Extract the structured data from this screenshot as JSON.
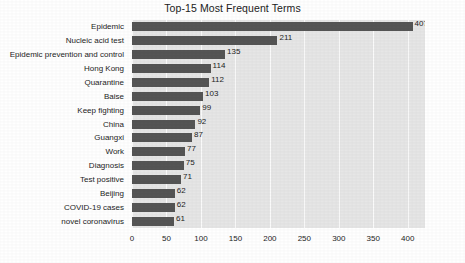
{
  "chart_data": {
    "type": "bar",
    "orientation": "horizontal",
    "title": "Top-15 Most Frequent Terms",
    "xlabel": "",
    "ylabel": "",
    "categories": [
      "Epidemic",
      "Nucleic acid test",
      "Epidemic prevention and control",
      "Hong Kong",
      "Quarantine",
      "Baise",
      "Keep fighting",
      "China",
      "Guangxi",
      "Work",
      "Diagnosis",
      "Test positive",
      "Beijing",
      "COVID-19 cases",
      "novel coronavirus"
    ],
    "values": [
      407,
      211,
      135,
      114,
      112,
      103,
      99,
      92,
      87,
      77,
      75,
      71,
      62,
      62,
      61
    ],
    "xlim": [
      0,
      425
    ],
    "xticks": [
      0,
      50,
      100,
      150,
      200,
      250,
      300,
      350,
      400
    ],
    "xtick_labels": [
      "0",
      "50",
      "100",
      "150",
      "200",
      "250",
      "300",
      "350",
      "400"
    ],
    "grid": true,
    "grid_axis": "x",
    "legend": null,
    "bar_color": "#555555",
    "plot_background": "#e6e6e6",
    "gridline_color": "#fbfbfb",
    "data_labels": [
      "407",
      "211",
      "135",
      "114",
      "112",
      "103",
      "99",
      "92",
      "87",
      "77",
      "75",
      "71",
      "62",
      "62",
      "61"
    ]
  }
}
